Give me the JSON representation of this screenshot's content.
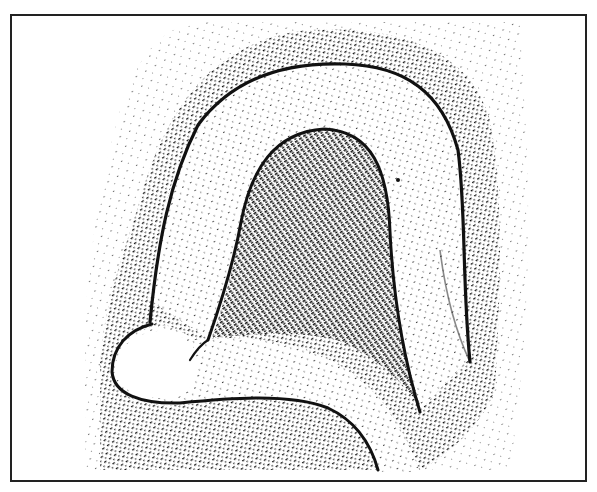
{
  "figure": {
    "type": "stippled line illustration",
    "style": "black-and-white hatched stipple texture",
    "colors": {
      "ink": "#111111",
      "paper": "#ffffff",
      "frame": "#222222"
    },
    "frame": {
      "left": 10,
      "top": 14,
      "right": 585,
      "bottom": 480
    }
  }
}
